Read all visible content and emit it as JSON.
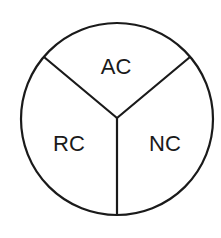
{
  "diagram": {
    "type": "three-sector-circle",
    "stroke_color": "#1a1a1a",
    "background": "#ffffff",
    "circle": {
      "cx": 117,
      "cy": 119,
      "r": 96
    },
    "center_point": {
      "x": 117,
      "y": 118
    },
    "dividers": [
      {
        "name": "upper-left-divider",
        "x2": 44,
        "y2": 57
      },
      {
        "name": "upper-right-divider",
        "x2": 190,
        "y2": 57
      },
      {
        "name": "bottom-divider",
        "x2": 117,
        "y2": 215
      }
    ],
    "sectors": [
      {
        "id": "ac",
        "label": "AC",
        "position": "top"
      },
      {
        "id": "rc",
        "label": "RC",
        "position": "bottom-left"
      },
      {
        "id": "nc",
        "label": "NC",
        "position": "bottom-right"
      }
    ]
  }
}
